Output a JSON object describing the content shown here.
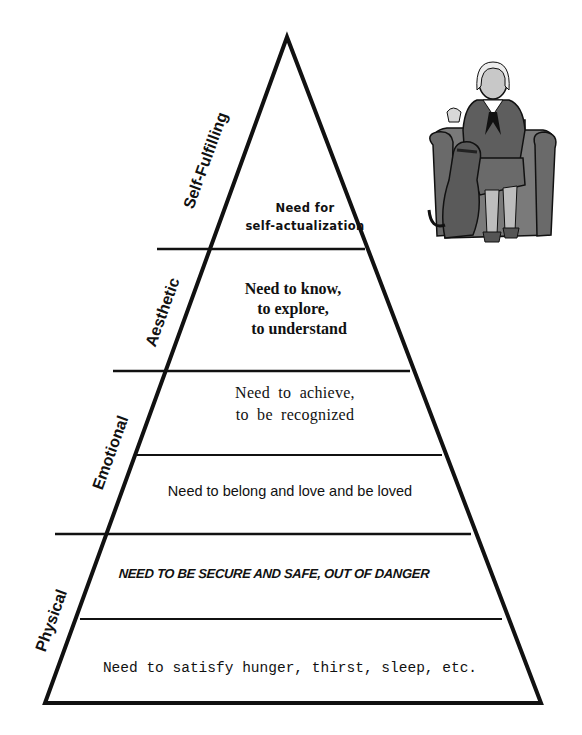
{
  "diagram": {
    "type": "pyramid",
    "colors": {
      "line": "#111111",
      "background": "#ffffff",
      "illustration": "#6e6e6e"
    },
    "categories": [
      {
        "label": "Self-Fulfilling"
      },
      {
        "label": "Aesthetic"
      },
      {
        "label": "Emotional"
      },
      {
        "label": "Physical"
      }
    ],
    "levels": [
      {
        "line1": "Need for",
        "line2": "self-actualization"
      },
      {
        "line1": "Need to know,",
        "line2": "to explore,",
        "line3": "to understand"
      },
      {
        "line1": "Need to achieve,",
        "line2": "to be recognized"
      },
      {
        "line1": "Need to belong and love and be loved"
      },
      {
        "line1": "NEED TO BE SECURE AND SAFE, OUT OF DANGER"
      },
      {
        "line1": "Need to satisfy hunger, thirst, sleep, etc."
      }
    ],
    "illustration": {
      "description": "woman-seated-in-armchair-with-dog"
    }
  }
}
